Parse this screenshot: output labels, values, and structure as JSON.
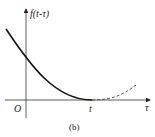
{
  "figure": {
    "y_axis_label": "f(t-τ)",
    "x_axis_label": "τ",
    "origin_label": "O",
    "t_label": "t",
    "caption": "(b)"
  },
  "colors": {
    "ink": "#222222"
  }
}
